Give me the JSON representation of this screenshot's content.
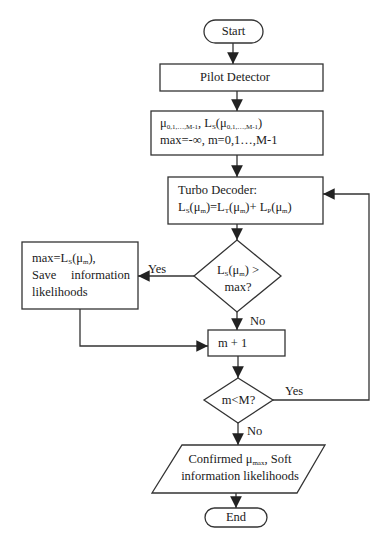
{
  "nodes": {
    "start": {
      "label": "Start"
    },
    "pilot": {
      "label": "Pilot Detector"
    },
    "init": {
      "line1_mu": "μ",
      "line1_mu_sub": "0,1,…,M-1",
      "line1_sep": ", L",
      "line1_L_sub": "S",
      "line1_open": "(μ",
      "line1_mu2_sub": "0,1,…,M-1",
      "line1_close": ")",
      "line2": "max=-∞, m=0,1…,M-1"
    },
    "turbo": {
      "line1": "Turbo Decoder:",
      "L": "L",
      "S": "S",
      "T": "T",
      "P": "P",
      "mu": "(μ",
      "m": "m",
      "eq": ")=L",
      "plus": ")+ L",
      "close": ")"
    },
    "decision1": {
      "L": "L",
      "S": "S",
      "mu": "(μ",
      "m": "m",
      "gt": ") >",
      "line2": "max?"
    },
    "save": {
      "line1_a": "max=L",
      "line1_sub": "S",
      "line1_b": "(μ",
      "line1_m": "m",
      "line1_c": "),",
      "line2": "Save information",
      "line3": "likelihoods"
    },
    "increment": {
      "label": "m + 1"
    },
    "decision2": {
      "label": "m<M?"
    },
    "output": {
      "line1_a": "Confirmed μ",
      "line1_sub": "max",
      "line1_b": ", Soft",
      "line2": "information likelihoods"
    },
    "end": {
      "label": "End"
    }
  },
  "edges": {
    "d1_yes": "Yes",
    "d1_no": "No",
    "d2_yes": "Yes",
    "d2_no": "No"
  },
  "colors": {
    "stroke": "#333333",
    "background": "#ffffff"
  }
}
